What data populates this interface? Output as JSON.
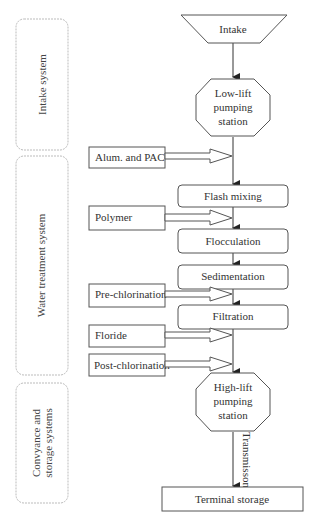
{
  "colors": {
    "stroke": "#555555",
    "text": "#333333",
    "group_stroke": "#bbbbbb",
    "background": "#ffffff"
  },
  "groups": [
    {
      "label": "Intake system"
    },
    {
      "label": "Water treatment system"
    },
    {
      "label_line1": "Convyance and",
      "label_line2": "storage systems"
    }
  ],
  "process": {
    "intake": "Intake",
    "low_lift": {
      "line1": "Low-lift",
      "line2": "pumping",
      "line3": "station"
    },
    "flash_mixing": "Flash mixing",
    "flocculation": "Flocculation",
    "sedimentation": "Sedimentation",
    "filtration": "Filtration",
    "high_lift": {
      "line1": "High-lift",
      "line2": "pumping",
      "line3": "station"
    },
    "terminal_storage": "Terminal storage",
    "transmission_label": "Transmisson"
  },
  "chemicals": [
    {
      "label": "Alum. and PAC"
    },
    {
      "label": "Polymer"
    },
    {
      "label": "Pre-chlorination"
    },
    {
      "label": "Floride"
    },
    {
      "label": "Post-chlorination"
    }
  ]
}
